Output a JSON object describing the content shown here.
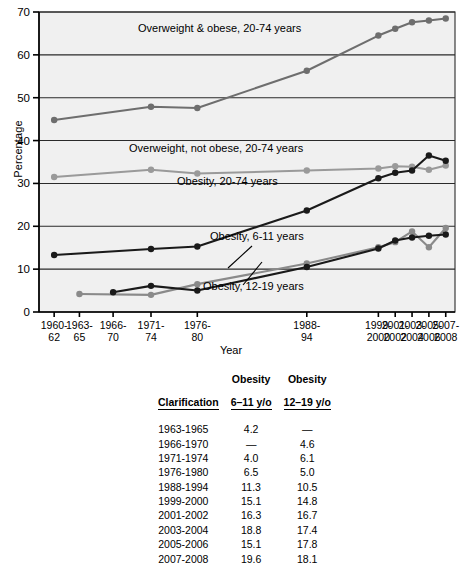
{
  "chart_data": {
    "type": "line",
    "title": "",
    "xlabel": "Year",
    "ylabel": "Percentage",
    "ylim": [
      0,
      70
    ],
    "ytick_step": 10,
    "yticks": [
      0,
      10,
      20,
      30,
      40,
      50,
      60,
      70
    ],
    "grid": "horizontal",
    "legend_position": "inline-annotations",
    "categories": [
      "1960-\n62",
      "1963-\n65",
      "1966-\n70",
      "1971-\n74",
      "1976-\n80",
      "1988-\n94",
      "1999-\n2000",
      "2001-\n2002",
      "2003-\n2004",
      "2005-\n2006",
      "2007-\n2008"
    ],
    "x_positions": [
      1961,
      1964,
      1968,
      1972.5,
      1978,
      1991,
      1999.5,
      2001.5,
      2003.5,
      2005.5,
      2007.5
    ],
    "series": [
      {
        "name": "Overweight & obese, 20-74 years",
        "color": "#6e6e6e",
        "values": [
          44.8,
          null,
          null,
          47.9,
          47.6,
          56.3,
          64.5,
          66.1,
          67.6,
          68.0,
          68.5
        ]
      },
      {
        "name": "Overweight, not obese, 20-74 years",
        "color": "#9a9a9a",
        "values": [
          31.5,
          null,
          null,
          33.2,
          32.3,
          33.0,
          33.5,
          34.0,
          33.9,
          33.2,
          34.2
        ]
      },
      {
        "name": "Obesity, 20-74 years",
        "color": "#1a1a1a",
        "values": [
          13.3,
          null,
          null,
          14.7,
          15.3,
          23.7,
          31.2,
          32.5,
          33.0,
          36.5,
          35.3
        ]
      },
      {
        "name": "Obesity, 6-11 years",
        "color": "#8a8a8a",
        "values": [
          null,
          4.2,
          null,
          4.0,
          6.5,
          11.3,
          15.1,
          16.3,
          18.8,
          15.1,
          19.6
        ]
      },
      {
        "name": "Obesity, 12-19 years",
        "color": "#1a1a1a",
        "values": [
          null,
          null,
          4.6,
          6.1,
          5.0,
          10.5,
          14.8,
          16.7,
          17.4,
          17.8,
          18.1
        ]
      }
    ],
    "annotations": [
      {
        "text": "Overweight & obese, 20-74 years",
        "x": 138,
        "y": 32
      },
      {
        "text": "Overweight, not obese, 20-74 years",
        "x": 129,
        "y": 152
      },
      {
        "text": "Obesity, 20-74 years",
        "x": 177,
        "y": 185
      },
      {
        "text": "Obesity, 6-11 years",
        "x": 210,
        "y": 240
      },
      {
        "text": "Obesity, 12-19 years",
        "x": 203,
        "y": 290
      }
    ]
  },
  "table": {
    "headers": {
      "col0": "Clarification",
      "col1_line1": "Obesity",
      "col1_line2": "6–11 y/o",
      "col2_line1": "Obesity",
      "col2_line2": "12–19 y/o"
    },
    "rows": [
      {
        "period": "1963-1965",
        "obesity_6_11": "4.2",
        "obesity_12_19": "—"
      },
      {
        "period": "1966-1970",
        "obesity_6_11": "—",
        "obesity_12_19": "4.6"
      },
      {
        "period": "1971-1974",
        "obesity_6_11": "4.0",
        "obesity_12_19": "6.1"
      },
      {
        "period": "1976-1980",
        "obesity_6_11": "6.5",
        "obesity_12_19": "5.0"
      },
      {
        "period": "1988-1994",
        "obesity_6_11": "11.3",
        "obesity_12_19": "10.5"
      },
      {
        "period": "1999-2000",
        "obesity_6_11": "15.1",
        "obesity_12_19": "14.8"
      },
      {
        "period": "2001-2002",
        "obesity_6_11": "16.3",
        "obesity_12_19": "16.7"
      },
      {
        "period": "2003-2004",
        "obesity_6_11": "18.8",
        "obesity_12_19": "17.4"
      },
      {
        "period": "2005-2006",
        "obesity_6_11": "15.1",
        "obesity_12_19": "17.8"
      },
      {
        "period": "2007-2008",
        "obesity_6_11": "19.6",
        "obesity_12_19": "18.1"
      }
    ]
  },
  "colors": {
    "plot_background": "#f0f0f0",
    "axis": "#000000",
    "gridline": "#2a2a2a",
    "dark_series": "#1a1a1a",
    "mid_series": "#6e6e6e",
    "light_series": "#9a9a9a"
  }
}
